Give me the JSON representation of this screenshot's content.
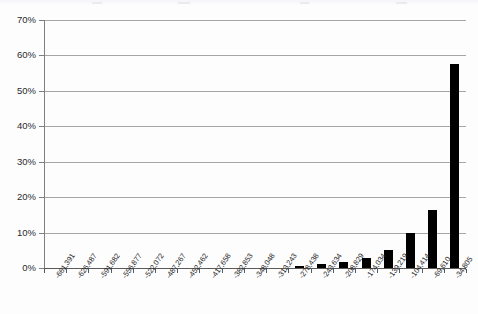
{
  "chart_data": {
    "type": "bar",
    "title": "",
    "subtitle": "",
    "xlabel": "",
    "ylabel": "",
    "grid": true,
    "legend": false,
    "ylim": [
      0,
      70
    ],
    "ytick_labels": [
      "70%",
      "60%",
      "50%",
      "40%",
      "30%",
      "20%",
      "10%",
      "0%"
    ],
    "ytick_values": [
      70,
      60,
      50,
      40,
      30,
      20,
      10,
      0
    ],
    "y_unit": "%",
    "categories": [
      "-661,391",
      "-626,487",
      "-591,682",
      "-556,877",
      "-522,072",
      "-487,267",
      "-452,462",
      "-417,658",
      "-382,853",
      "-348,048",
      "-313,243",
      "-278,438",
      "-243,634",
      "-208,829",
      "-174,034",
      "-139,219",
      "-104,414",
      "-69,610",
      "-34,805"
    ],
    "values": [
      0,
      0,
      0,
      0,
      0,
      0,
      0,
      0,
      0,
      0,
      0,
      0.6,
      1.0,
      1.8,
      2.9,
      5.1,
      9.8,
      16.5,
      57.5
    ],
    "bar_color": "#000000",
    "gridline_color": "#A6A6A6",
    "axis_color": "#7F7F7F",
    "plot_background": "#FFFFFF"
  }
}
